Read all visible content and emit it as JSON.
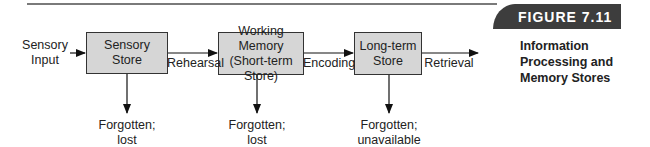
{
  "figure": {
    "number": "FIGURE 7.11",
    "caption": "Information Processing and Memory Stores",
    "header_color": "#3d3d3d",
    "box_fill": "#d6d6d6"
  },
  "diagram": {
    "input_label": "Sensory Input",
    "nodes": [
      {
        "id": "sensory",
        "label": "Sensory Store"
      },
      {
        "id": "working",
        "label": "Working Memory (Short-term Store)"
      },
      {
        "id": "longterm",
        "label": "Long-term Store"
      }
    ],
    "edges": [
      {
        "from": "input",
        "to": "sensory",
        "label": ""
      },
      {
        "from": "sensory",
        "to": "working",
        "label": "Rehearsal"
      },
      {
        "from": "working",
        "to": "longterm",
        "label": "Encoding"
      },
      {
        "from": "longterm",
        "to": "out",
        "label": "Retrieval"
      }
    ],
    "outcomes": [
      {
        "from": "sensory",
        "label": "Forgotten; lost"
      },
      {
        "from": "working",
        "label": "Forgotten; lost"
      },
      {
        "from": "longterm",
        "label": "Forgotten; unavailable"
      }
    ]
  }
}
